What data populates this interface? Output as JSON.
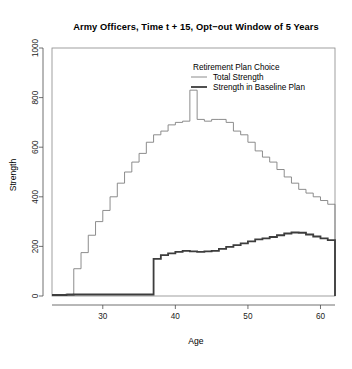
{
  "chart_data": {
    "type": "line",
    "subtype": "step",
    "title": "Army Officers, Time t + 15, Opt−out Window of 5 Years",
    "xlabel": "Age",
    "ylabel": "Strength",
    "xlim": [
      23,
      62
    ],
    "ylim": [
      0,
      1000
    ],
    "xticks": [
      30,
      40,
      50,
      60
    ],
    "yticks": [
      0,
      200,
      400,
      600,
      800,
      1000
    ],
    "xtick_labels": [
      "30",
      "40",
      "50",
      "60"
    ],
    "ytick_labels": [
      "0",
      "200",
      "400",
      "600",
      "800",
      "1000"
    ],
    "grid": false,
    "legend": {
      "title": "Retirement Plan Choice",
      "position": "top-right-inside",
      "entries": [
        {
          "name": "Total Strength",
          "color": "#808080",
          "width": 0.9
        },
        {
          "name": "Strength in Baseline Plan",
          "color": "#3d3d3d",
          "width": 1.8
        }
      ]
    },
    "x": [
      23,
      24,
      25,
      26,
      27,
      28,
      29,
      30,
      31,
      32,
      33,
      34,
      35,
      36,
      37,
      38,
      39,
      40,
      41,
      42,
      43,
      44,
      45,
      46,
      47,
      48,
      49,
      50,
      51,
      52,
      53,
      54,
      55,
      56,
      57,
      58,
      59,
      60,
      61,
      62
    ],
    "series": [
      {
        "name": "Total Strength",
        "color": "#808080",
        "values": [
          5,
          6,
          8,
          110,
          175,
          245,
          300,
          345,
          400,
          455,
          500,
          540,
          575,
          620,
          650,
          665,
          690,
          700,
          705,
          830,
          712,
          705,
          712,
          712,
          700,
          665,
          650,
          620,
          585,
          560,
          540,
          510,
          480,
          455,
          430,
          415,
          400,
          385,
          370,
          290
        ]
      },
      {
        "name": "Strength in Baseline Plan",
        "color": "#3d3d3d",
        "values": [
          4,
          4,
          5,
          6,
          6,
          6,
          6,
          6,
          6,
          6,
          6,
          6,
          6,
          6,
          150,
          165,
          172,
          178,
          182,
          180,
          178,
          180,
          182,
          190,
          198,
          205,
          212,
          220,
          228,
          232,
          238,
          245,
          252,
          256,
          255,
          248,
          240,
          232,
          225,
          130
        ]
      }
    ]
  },
  "geometry": {
    "plot_left": 52,
    "plot_right": 335,
    "plot_top": 48,
    "plot_bottom": 296,
    "title_x": 196,
    "title_y": 30,
    "xlabel_x": 196,
    "xlabel_y": 344,
    "ylabel_x": 16,
    "ylabel_y": 175,
    "legend_title_x": 193,
    "legend_title_y": 70,
    "legend_row1_y": 80,
    "legend_row2_y": 90,
    "legend_swatch_x1": 191,
    "legend_swatch_x2": 207,
    "legend_text_x": 213
  }
}
